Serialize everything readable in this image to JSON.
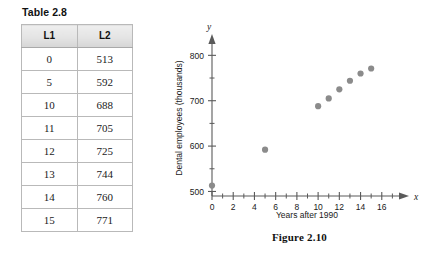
{
  "table": {
    "caption": "Table 2.8",
    "columns": [
      "L1",
      "L2"
    ],
    "rows": [
      [
        "0",
        "513"
      ],
      [
        "5",
        "592"
      ],
      [
        "10",
        "688"
      ],
      [
        "11",
        "705"
      ],
      [
        "12",
        "725"
      ],
      [
        "13",
        "744"
      ],
      [
        "14",
        "760"
      ],
      [
        "15",
        "771"
      ]
    ]
  },
  "figure": {
    "caption": "Figure 2.10",
    "x_axis_name": "x",
    "y_axis_name": "y",
    "xlabel": "Years after 1990",
    "ylabel": "Dental employees (thousands)",
    "point_color": "#8b8b8b",
    "axis_color": "#5a5a5a"
  },
  "chart_data": {
    "type": "scatter",
    "title": "Figure 2.10",
    "xlabel": "Years after 1990",
    "ylabel": "Dental employees (thousands)",
    "x": [
      0,
      5,
      10,
      11,
      12,
      13,
      14,
      15
    ],
    "y": [
      513,
      592,
      688,
      705,
      725,
      744,
      760,
      771
    ],
    "xlim": [
      0,
      18
    ],
    "ylim": [
      490,
      825
    ],
    "xticks": [
      0,
      2,
      4,
      6,
      8,
      10,
      12,
      14,
      16
    ],
    "xtick_labels": [
      "0",
      "2",
      "4",
      "6",
      "8",
      "10",
      "12",
      "14",
      "16"
    ],
    "xminor_step": 1,
    "yticks": [
      500,
      600,
      700,
      800
    ],
    "ytick_labels": [
      "500",
      "600",
      "700",
      "800"
    ],
    "yminor_step": 50,
    "grid": false,
    "legend": null,
    "marker": "circle",
    "marker_color": "#8b8b8b"
  }
}
